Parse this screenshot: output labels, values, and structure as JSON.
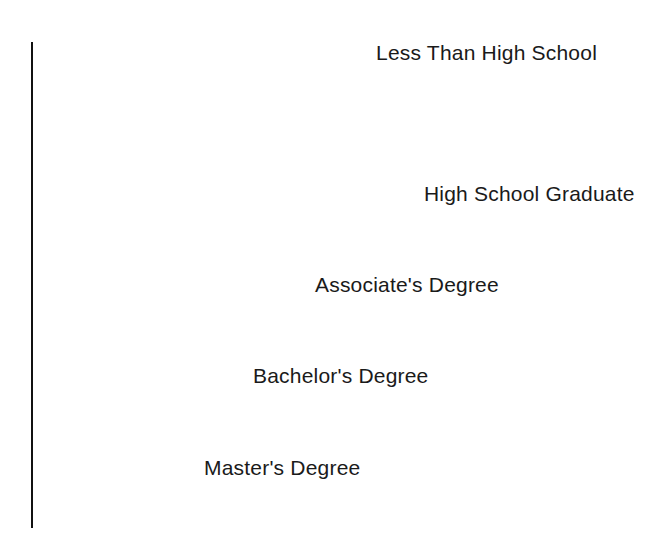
{
  "chart_data": {
    "type": "bar",
    "orientation": "horizontal",
    "title": "",
    "subtitle": "",
    "xlabel": "",
    "ylabel": "",
    "grid": false,
    "legend": "none",
    "axis_color": "#111111",
    "bar_color": "#141414",
    "value_label_color": "#ffffff",
    "category_label_color": "#1a1a1a",
    "background": "#ffffff",
    "xlim": [
      0,
      15.5
    ],
    "value_suffix": "%",
    "categories": [
      "Less Than High School",
      "High School Graduate",
      "Associate's Degree",
      "Bachelor's Degree",
      "Master's Degree"
    ],
    "values": [
      14.6,
      9.7,
      6.8,
      5.2,
      3.9
    ],
    "value_labels": [
      "14.6%",
      "9.7%",
      "6.8%",
      "5.2%",
      "3.9%"
    ],
    "bars": [
      {
        "category": "Less Than High School",
        "value": 14.6,
        "value_label": "14.6%",
        "label_position": "above-bar-end",
        "px": {
          "top": 70,
          "height": 68,
          "width": 564
        }
      },
      {
        "category": "High School Graduate",
        "value": 9.7,
        "value_label": "9.7%",
        "label_position": "right-of-bar",
        "px": {
          "top": 159,
          "height": 69,
          "width": 373
        }
      },
      {
        "category": "Associate's Degree",
        "value": 6.8,
        "value_label": "6.8%",
        "label_position": "right-of-bar",
        "px": {
          "top": 250,
          "height": 70,
          "width": 264
        }
      },
      {
        "category": "Bachelor's Degree",
        "value": 5.2,
        "value_label": "5.2%",
        "label_position": "right-of-bar",
        "px": {
          "top": 341,
          "height": 70,
          "width": 202
        }
      },
      {
        "category": "Master's Degree",
        "value": 3.9,
        "value_label": "3.9%",
        "label_position": "right-of-bar",
        "px": {
          "top": 432,
          "height": 71,
          "width": 153
        }
      }
    ]
  }
}
